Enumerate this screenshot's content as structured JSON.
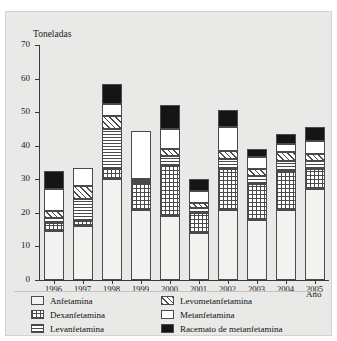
{
  "chart_title": "",
  "axis": {
    "ylabel": "Toneladas",
    "xlabel": "Año",
    "yticks": [
      0,
      10,
      20,
      30,
      40,
      50,
      60,
      70
    ],
    "ylim": [
      0,
      70
    ]
  },
  "legend": {
    "column1": [
      {
        "label": "Anfetamina",
        "pattern": "dots"
      },
      {
        "label": "Dexanfetamina",
        "pattern": "grid"
      },
      {
        "label": "Levanfetamina",
        "pattern": "horizontal-lines"
      }
    ],
    "column2": [
      {
        "label": "Levometanfetamina",
        "pattern": "diagonal-hatch"
      },
      {
        "label": "Metanfetamina",
        "pattern": "solid-white"
      },
      {
        "label": "Racemato de metanfetamina",
        "pattern": "solid-black"
      }
    ]
  },
  "chart_data": {
    "type": "bar",
    "stacked": true,
    "title": "",
    "xlabel": "Año",
    "ylabel": "Toneladas",
    "ylim": [
      0,
      70
    ],
    "grid": false,
    "legend_position": "bottom",
    "categories": [
      "1996",
      "1997",
      "1998",
      "1999",
      "2000",
      "2001",
      "2002",
      "2003",
      "2004",
      "2005"
    ],
    "series": [
      {
        "name": "Anfetamina",
        "values": [
          14.5,
          16.0,
          30.0,
          21.0,
          19.0,
          14.0,
          21.0,
          18.0,
          21.0,
          27.0
        ]
      },
      {
        "name": "Dexanfetamina",
        "values": [
          2.5,
          1.5,
          3.0,
          8.0,
          15.0,
          6.0,
          12.0,
          10.5,
          11.5,
          6.0
        ]
      },
      {
        "name": "Levanfetamina",
        "values": [
          1.5,
          6.5,
          12.0,
          0.5,
          3.0,
          1.5,
          3.0,
          2.5,
          3.0,
          2.5
        ]
      },
      {
        "name": "Levometanfetamina",
        "values": [
          2.0,
          4.0,
          4.0,
          0.5,
          2.0,
          1.5,
          2.5,
          2.0,
          2.5,
          2.0
        ]
      },
      {
        "name": "Metanfetamina",
        "values": [
          6.5,
          5.5,
          3.5,
          14.5,
          6.0,
          3.5,
          7.0,
          3.5,
          2.5,
          4.0
        ]
      },
      {
        "name": "Racemato de metanfetamina",
        "values": [
          5.5,
          0.0,
          6.0,
          0.0,
          7.0,
          3.5,
          5.0,
          2.5,
          3.0,
          4.0
        ]
      }
    ],
    "totals": [
      32.5,
      33.5,
      58.5,
      44.5,
      52.0,
      30.0,
      50.5,
      39.0,
      43.5,
      45.5
    ]
  }
}
